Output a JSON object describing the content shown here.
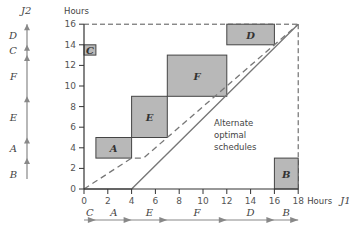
{
  "chart_data": {
    "type": "diagram",
    "xlabel": "Hours J1",
    "ylabel": "Hours",
    "y_axis_job": "J2",
    "xlim": [
      0,
      18
    ],
    "ylim": [
      0,
      16
    ],
    "x_ticks": [
      "0",
      "2",
      "4",
      "6",
      "8",
      "10",
      "12",
      "14",
      "16",
      "18"
    ],
    "y_ticks": [
      "0",
      "2",
      "4",
      "6",
      "8",
      "10",
      "12",
      "14",
      "16"
    ],
    "blocked_regions": [
      {
        "label": "C",
        "x": [
          0,
          1
        ],
        "y": [
          13,
          14
        ]
      },
      {
        "label": "A",
        "x": [
          1,
          4
        ],
        "y": [
          3,
          5
        ]
      },
      {
        "label": "E",
        "x": [
          4,
          7
        ],
        "y": [
          5,
          9
        ]
      },
      {
        "label": "F",
        "x": [
          7,
          12
        ],
        "y": [
          9,
          13
        ]
      },
      {
        "label": "D",
        "x": [
          12,
          16
        ],
        "y": [
          14,
          16
        ]
      },
      {
        "label": "B",
        "x": [
          16,
          18
        ],
        "y": [
          0,
          3
        ]
      }
    ],
    "schedules": [
      {
        "name": "solid",
        "points": [
          [
            0,
            0
          ],
          [
            4,
            0
          ],
          [
            18,
            16
          ]
        ]
      },
      {
        "name": "dashed",
        "points": [
          [
            0,
            0
          ],
          [
            4,
            3
          ],
          [
            5,
            3
          ],
          [
            18,
            16
          ]
        ]
      }
    ],
    "annotation": "Alternate optimal schedules",
    "j1_sequence": [
      {
        "label": "C",
        "start": 0,
        "end": 1
      },
      {
        "label": "A",
        "start": 1,
        "end": 4
      },
      {
        "label": "E",
        "start": 4,
        "end": 7
      },
      {
        "label": "F",
        "start": 7,
        "end": 12
      },
      {
        "label": "D",
        "start": 12,
        "end": 16
      },
      {
        "label": "B",
        "start": 16,
        "end": 18
      }
    ],
    "j2_sequence": [
      {
        "label": "B",
        "start": 0,
        "end": 3
      },
      {
        "label": "A",
        "start": 3,
        "end": 5
      },
      {
        "label": "E",
        "start": 5,
        "end": 9
      },
      {
        "label": "F",
        "start": 9,
        "end": 13
      },
      {
        "label": "C",
        "start": 13,
        "end": 14
      },
      {
        "label": "D",
        "start": 14,
        "end": 16
      }
    ]
  },
  "labels": {
    "y_title": "Hours",
    "x_title": "Hours",
    "j1": "J1",
    "j2": "J2",
    "annotation_lines": [
      "Alternate",
      "optimal",
      "schedules"
    ]
  }
}
